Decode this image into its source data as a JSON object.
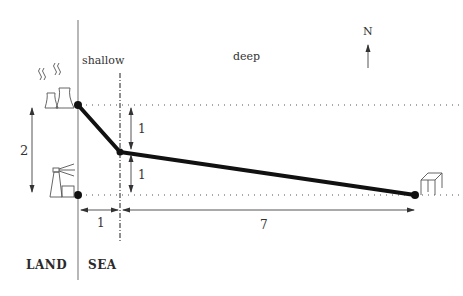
{
  "labels": {
    "shallow": "shallow",
    "deep": "deep",
    "north": "N",
    "land": "LAND",
    "sea": "SEA"
  },
  "dimensions": {
    "total_vertical": "2",
    "upper_vertical": "1",
    "lower_vertical": "1",
    "shallow_width": "1",
    "deep_width": "7"
  },
  "icons": {
    "power_plant": "power-plant-icon",
    "lighthouse": "lighthouse-icon",
    "platform": "offshore-platform-icon",
    "north_arrow": "north-arrow-icon"
  },
  "colors": {
    "path": "#111111",
    "lines": "#888888",
    "text": "#333333"
  }
}
